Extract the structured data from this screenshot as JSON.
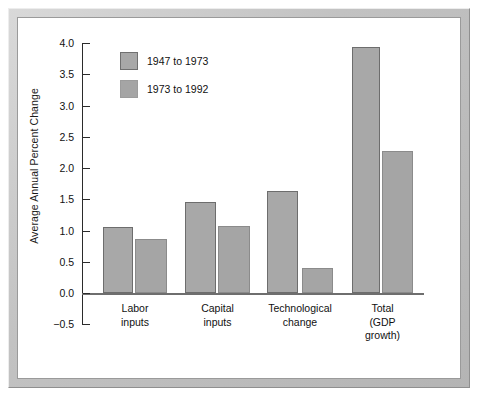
{
  "chart_data": {
    "type": "bar",
    "title": "",
    "subtitle": "",
    "xlabel": "",
    "ylabel": "Average Annual Percent Change",
    "ylim": [
      -0.5,
      4.0
    ],
    "ytick_labels": [
      "4.0",
      "3.5",
      "3.0",
      "2.5",
      "2.0",
      "1.5",
      "1.0",
      "0.5",
      "0.0",
      "−0.5"
    ],
    "ytick_values": [
      4.0,
      3.5,
      3.0,
      2.5,
      2.0,
      1.5,
      1.0,
      0.5,
      0.0,
      -0.5
    ],
    "grid": false,
    "legend_position": "upper-left-inside",
    "categories": [
      "Labor\ninputs",
      "Capital\ninputs",
      "Technological\nchange",
      "Total\n(GDP\ngrowth)"
    ],
    "category_lines": [
      [
        "Labor",
        "inputs"
      ],
      [
        "Capital",
        "inputs"
      ],
      [
        "Technological",
        "change"
      ],
      [
        "Total",
        "(GDP",
        "growth)"
      ]
    ],
    "series": [
      {
        "name": "1947 to 1973",
        "color": "#a8a8a8",
        "values": [
          1.05,
          1.46,
          1.64,
          3.93
        ]
      },
      {
        "name": "1973 to 1992",
        "color": "#a5a5a5",
        "values": [
          0.87,
          1.07,
          0.4,
          2.28
        ]
      }
    ]
  },
  "figure": {
    "frame_color": "#c2c2c2",
    "plot_background": "#ffffff",
    "axis_color": "#2b2b2b",
    "baseline_color": "#6e6e6e"
  }
}
